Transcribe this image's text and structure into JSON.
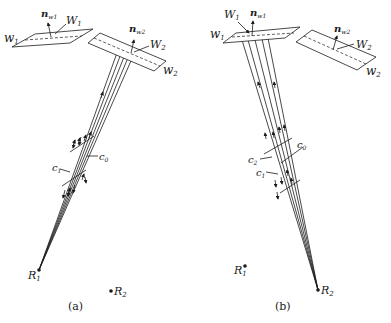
{
  "panels": [
    {
      "id": "a",
      "caption": "(a)",
      "labels": {
        "plate1": "w",
        "plate1_sub": "1",
        "W1": "W",
        "W1_sub": "1",
        "n1": "n",
        "n1_sub": "w1",
        "plate2": "w",
        "plate2_sub": "2",
        "W2": "W",
        "W2_sub": "2",
        "n2": "n",
        "n2_sub": "w2",
        "c1": "c",
        "c1_sub": "1",
        "c0": "c",
        "c0_sub": "0",
        "R1": "R",
        "R1_sub": "1",
        "R2": "R",
        "R2_sub": "2"
      }
    },
    {
      "id": "b",
      "caption": "(b)",
      "labels": {
        "plate1": "w",
        "plate1_sub": "1",
        "W1": "W",
        "W1_sub": "1",
        "n1": "n",
        "n1_sub": "w1",
        "plate2": "w",
        "plate2_sub": "2",
        "W2": "W",
        "W2_sub": "2",
        "n2": "n",
        "n2_sub": "w2",
        "c2": "c",
        "c2_sub": "2",
        "c1": "c",
        "c1_sub": "1",
        "c0": "c",
        "c0_sub": "0",
        "R1": "R",
        "R1_sub": "1",
        "R2": "R",
        "R2_sub": "2"
      }
    }
  ]
}
